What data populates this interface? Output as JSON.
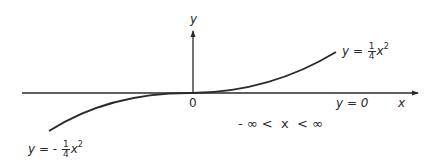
{
  "diagram": {
    "axes": {
      "x_label": "x",
      "y_label": "y",
      "origin_label": "0"
    },
    "curves": [
      {
        "name": "upper",
        "equation_lhs": "y =",
        "sign": "",
        "coef_num": "1",
        "coef_den": "4",
        "var": "x",
        "exp": "2"
      },
      {
        "name": "lower",
        "equation_lhs": "y =",
        "sign": "-",
        "coef_num": "1",
        "coef_den": "4",
        "var": "x",
        "exp": "2"
      }
    ],
    "asymptote_label": "y = 0",
    "domain_label": "- ∞ <  x  < ∞",
    "colors": {
      "line": "#2a2a2a",
      "background": "#ffffff"
    }
  }
}
